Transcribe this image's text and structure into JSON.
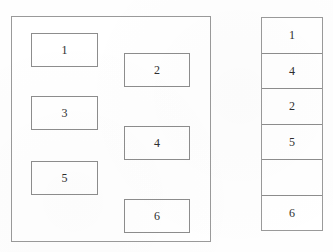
{
  "diagram": {
    "type": "box-layout-diagram",
    "background_color": "#fefefe",
    "border_color": "#8d8d8d",
    "text_color": "#2e2e2e",
    "outer_panel": {
      "name": "left-container",
      "x": 11,
      "y": 16,
      "width": 200,
      "height": 226
    },
    "boxes": [
      {
        "label": "1",
        "column": "left",
        "x": 31,
        "y": 33,
        "width": 67,
        "height": 34
      },
      {
        "label": "2",
        "column": "right",
        "x": 124,
        "y": 53,
        "width": 66,
        "height": 34
      },
      {
        "label": "3",
        "column": "left",
        "x": 31,
        "y": 96,
        "width": 67,
        "height": 34
      },
      {
        "label": "4",
        "column": "right",
        "x": 124,
        "y": 126,
        "width": 66,
        "height": 34
      },
      {
        "label": "5",
        "column": "left",
        "x": 31,
        "y": 161,
        "width": 67,
        "height": 34
      },
      {
        "label": "6",
        "column": "right",
        "x": 124,
        "y": 199,
        "width": 66,
        "height": 34
      }
    ],
    "stack_column": {
      "name": "right-stack",
      "x": 261,
      "y": 17,
      "width": 62,
      "height": 214,
      "cells": [
        {
          "label": "1",
          "empty": false
        },
        {
          "label": "4",
          "empty": false
        },
        {
          "label": "2",
          "empty": false
        },
        {
          "label": "5",
          "empty": false
        },
        {
          "label": "",
          "empty": true
        },
        {
          "label": "6",
          "empty": false
        }
      ]
    }
  }
}
